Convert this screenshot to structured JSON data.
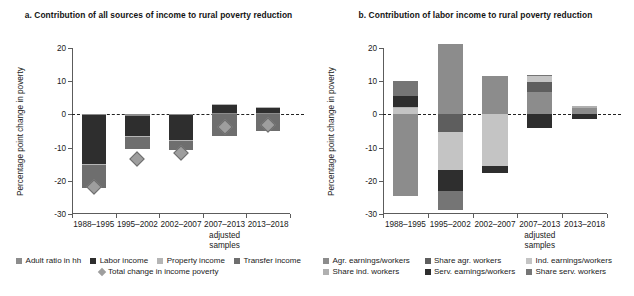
{
  "figure": {
    "width": 634,
    "height": 296
  },
  "panel_a": {
    "title": "a. Contribution of all sources of income to rural poverty reduction",
    "ylabel": "Percentage point change in poverty"
  },
  "panel_b": {
    "title": "b. Contribution of labor income to rural poverty reduction",
    "ylabel": "Percentage point change in poverty"
  },
  "chart_data": [
    {
      "type": "bar",
      "panel": "a",
      "title": "a. Contribution of all sources of income to rural poverty reduction",
      "xlabel": "",
      "ylabel": "Percentage point change in poverty",
      "ylim": [
        -30,
        20
      ],
      "yticks": [
        20,
        10,
        0,
        -10,
        -20,
        -30
      ],
      "ytick_labels": [
        "20",
        "10",
        "0",
        "-10",
        "-20",
        "-30"
      ],
      "grid": false,
      "stacked": true,
      "zero_line": true,
      "legend_position": "bottom",
      "categories": [
        "1988–1995",
        "1995–2002",
        "2002–2007",
        "2007–2013",
        "2013–2018"
      ],
      "category_note_index": 3,
      "category_note": "adjusted\nsamples",
      "series": [
        {
          "name": "Adult ratio in hh",
          "color": "#8c8c8c",
          "values": [
            -0.3,
            -0.4,
            -0.3,
            0.4,
            0.3
          ]
        },
        {
          "name": "Labor income",
          "color": "#2e2e2e",
          "values": [
            -14.6,
            -6.1,
            -7.3,
            2.5,
            1.6
          ]
        },
        {
          "name": "Property income",
          "color": "#b5b5b5",
          "values": [
            -0.2,
            -0.3,
            -0.3,
            0.2,
            0.2
          ]
        },
        {
          "name": "Transfer income",
          "color": "#6e6e6e",
          "values": [
            -7.0,
            -3.5,
            -2.9,
            -6.5,
            -5.1
          ]
        }
      ],
      "marker_series": {
        "name": "Total change in income poverty",
        "color": "#9e9e9e",
        "shape": "diamond",
        "values": [
          -22.0,
          -13.5,
          -11.5,
          -3.7,
          -3.3
        ]
      },
      "legend": [
        {
          "label": "Adult ratio in hh",
          "color": "#8c8c8c",
          "shape": "square"
        },
        {
          "label": "Labor income",
          "color": "#2e2e2e",
          "shape": "square"
        },
        {
          "label": "Property income",
          "color": "#b5b5b5",
          "shape": "square"
        },
        {
          "label": "Transfer income",
          "color": "#6e6e6e",
          "shape": "square"
        },
        {
          "label": "Total change in income poverty",
          "color": "#9e9e9e",
          "shape": "diamond"
        }
      ]
    },
    {
      "type": "bar",
      "panel": "b",
      "title": "b. Contribution of labor income to rural poverty reduction",
      "xlabel": "",
      "ylabel": "Percentage point change in poverty",
      "ylim": [
        -30,
        20
      ],
      "yticks": [
        20,
        10,
        0,
        -10,
        -20,
        -30
      ],
      "ytick_labels": [
        "20",
        "10",
        "0",
        "-10",
        "-20",
        "-30"
      ],
      "grid": false,
      "stacked": true,
      "zero_line": true,
      "legend_position": "bottom",
      "categories": [
        "1988–1995",
        "1995–2002",
        "2002–2007",
        "2007–2013",
        "2013–2018"
      ],
      "category_note_index": 3,
      "category_note": "adjusted\nsamples",
      "series": [
        {
          "name": "Agr. earnings/workers",
          "color": "#8c8c8c",
          "values": [
            -24.5,
            21.3,
            11.5,
            6.8,
            1.8
          ]
        },
        {
          "name": "Share agr. workers",
          "color": "#5e5e5e",
          "values": [
            0.0,
            -5.2,
            0.0,
            3.0,
            0.0
          ]
        },
        {
          "name": "Ind. earnings/workers",
          "color": "#c4c4c4",
          "values": [
            1.9,
            -11.5,
            -15.5,
            1.8,
            0.0
          ]
        },
        {
          "name": "Share ind. workers",
          "color": "#b0b0b0",
          "values": [
            0.4,
            0.0,
            0.0,
            0.0,
            0.7
          ]
        },
        {
          "name": "Serv. earnings/workers",
          "color": "#2e2e2e",
          "values": [
            3.3,
            -6.5,
            -2.3,
            -4.2,
            -1.4
          ]
        },
        {
          "name": "Share serv. workers",
          "color": "#757575",
          "values": [
            4.4,
            -5.6,
            0.0,
            0.4,
            0.0
          ]
        }
      ],
      "legend": [
        {
          "label": "Agr. earnings/workers",
          "color": "#8c8c8c",
          "shape": "square"
        },
        {
          "label": "Share agr. workers",
          "color": "#5e5e5e",
          "shape": "square"
        },
        {
          "label": "Ind. earnings/workers",
          "color": "#c4c4c4",
          "shape": "square"
        },
        {
          "label": "Share ind. workers",
          "color": "#b0b0b0",
          "shape": "square"
        },
        {
          "label": "Serv. earnings/workers",
          "color": "#2e2e2e",
          "shape": "square"
        },
        {
          "label": "Share serv. workers",
          "color": "#757575",
          "shape": "square"
        }
      ]
    }
  ]
}
